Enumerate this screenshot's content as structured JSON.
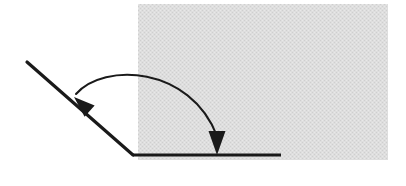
{
  "figure": {
    "name": "angle-rotation-diagram",
    "width": 406,
    "height": 186,
    "background_color": "#ffffff",
    "stroke_color": "#1a1a1a",
    "shaded_region": {
      "name": "gray-shaded-rectangle",
      "fill_color": "#d9d9d9",
      "pattern": "dithered-halftone",
      "x": 138,
      "y": 4,
      "width": 250,
      "height": 156
    },
    "vertex": {
      "x": 133,
      "y": 155
    },
    "horizontal_ray": {
      "name": "horizontal-ray",
      "x1": 133,
      "y1": 155,
      "x2": 281,
      "y2": 155,
      "stroke_width": 3.2
    },
    "oblique_ray": {
      "name": "oblique-ray",
      "x1": 133,
      "y1": 155,
      "x2": 27,
      "y2": 62,
      "stroke_width": 3.2
    },
    "arc_arrow": {
      "name": "rotation-arc-arrow",
      "stroke_width": 2.0,
      "start": {
        "x": 76,
        "y": 94
      },
      "control_1": {
        "x": 104,
        "y": 62
      },
      "control_2": {
        "x": 190,
        "y": 66
      },
      "end": {
        "x": 217,
        "y": 136
      },
      "double_headed": true,
      "arrowhead_left": {
        "name": "arrowhead-left",
        "tip_x": 74,
        "tip_y": 97,
        "direction_degrees": 222
      },
      "arrowhead_right": {
        "name": "arrowhead-right",
        "tip_x": 217,
        "tip_y": 155,
        "direction_degrees": 90
      }
    }
  }
}
